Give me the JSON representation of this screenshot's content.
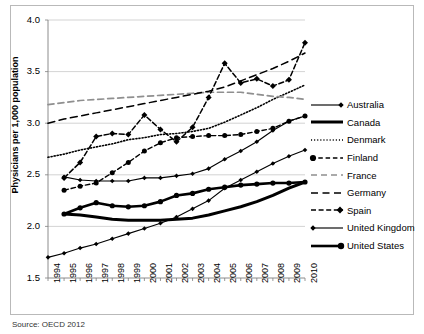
{
  "axes": {
    "ylabel": "Physicians per 1,000 population",
    "yticks": [
      "4.0",
      "3.5",
      "3.0",
      "2.5",
      "2.0",
      "1.5"
    ],
    "xticks": [
      "1994",
      "1995",
      "1996",
      "1997",
      "1998",
      "1999",
      "2000",
      "2001",
      "2002",
      "2003",
      "2004",
      "2005",
      "2006",
      "2007",
      "2008",
      "2009",
      "2010"
    ]
  },
  "legend": {
    "items": [
      {
        "label": "Australia",
        "key": "solid-diamond-marker"
      },
      {
        "label": "Canada",
        "key": "thick-solid-line"
      },
      {
        "label": "Denmark",
        "key": "dotted-line"
      },
      {
        "label": "Finland",
        "key": "dashed-circle-marker"
      },
      {
        "label": "France",
        "key": "light-dashed-line"
      },
      {
        "label": "Germany",
        "key": "dashed-line"
      },
      {
        "label": "Spain",
        "key": "dashed-diamond-marker"
      },
      {
        "label": "United Kingdom",
        "key": "solid-diamond-marker"
      },
      {
        "label": "United States",
        "key": "solid-circle-marker"
      }
    ]
  },
  "caption": "Source: OECD 2012",
  "colors": {
    "line": "#000000",
    "grid": "#c8c8c8",
    "axis": "#808080",
    "frame": "#b9b9b9",
    "background": "#ffffff"
  },
  "chart_data": {
    "type": "line",
    "title": "",
    "xlabel": "",
    "ylabel": "Physicians per 1,000 population",
    "ylim": [
      1.5,
      4.0
    ],
    "grid": true,
    "legend_position": "right",
    "x": [
      1994,
      1995,
      1996,
      1997,
      1998,
      1999,
      2000,
      2001,
      2002,
      2003,
      2004,
      2005,
      2006,
      2007,
      2008,
      2009,
      2010
    ],
    "series": [
      {
        "name": "Australia",
        "style": "solid-diamond",
        "values": [
          null,
          2.48,
          2.45,
          2.44,
          2.44,
          2.44,
          2.47,
          2.47,
          2.49,
          2.51,
          2.56,
          2.65,
          2.73,
          2.82,
          2.93,
          3.02,
          3.07
        ]
      },
      {
        "name": "Canada",
        "style": "thick-solid",
        "values": [
          null,
          2.12,
          2.11,
          2.09,
          2.07,
          2.06,
          2.06,
          2.06,
          2.07,
          2.08,
          2.11,
          2.15,
          2.19,
          2.24,
          2.3,
          2.37,
          2.43
        ]
      },
      {
        "name": "Denmark",
        "style": "dotted",
        "values": [
          2.67,
          2.7,
          2.74,
          2.77,
          2.8,
          2.84,
          2.86,
          2.89,
          2.9,
          2.92,
          2.95,
          3.01,
          3.08,
          3.15,
          3.23,
          3.3,
          3.37
        ]
      },
      {
        "name": "Finland",
        "style": "dashed-circle",
        "values": [
          null,
          2.35,
          2.39,
          2.42,
          2.52,
          2.62,
          2.73,
          2.81,
          2.86,
          2.87,
          2.88,
          2.88,
          2.89,
          2.92,
          2.95,
          3.02,
          3.07
        ]
      },
      {
        "name": "France",
        "style": "light-dashed",
        "values": [
          3.18,
          3.2,
          3.22,
          3.23,
          3.24,
          3.25,
          3.26,
          3.27,
          3.28,
          3.29,
          3.3,
          3.3,
          3.3,
          3.28,
          3.26,
          3.25,
          3.23
        ]
      },
      {
        "name": "Germany",
        "style": "dashed",
        "values": [
          3.0,
          3.04,
          3.07,
          3.1,
          3.13,
          3.16,
          3.19,
          3.22,
          3.25,
          3.28,
          3.31,
          3.35,
          3.41,
          3.47,
          3.53,
          3.6,
          3.68
        ]
      },
      {
        "name": "Spain",
        "style": "dashed-diamond",
        "values": [
          null,
          2.47,
          2.62,
          2.87,
          2.9,
          2.89,
          3.08,
          2.94,
          2.82,
          2.96,
          3.25,
          3.58,
          3.39,
          3.43,
          3.36,
          3.42,
          3.78
        ]
      },
      {
        "name": "United Kingdom",
        "style": "solid-diamond",
        "values": [
          1.7,
          1.74,
          1.79,
          1.83,
          1.88,
          1.93,
          1.98,
          2.03,
          2.09,
          2.17,
          2.25,
          2.37,
          2.45,
          2.53,
          2.61,
          2.68,
          2.74
        ]
      },
      {
        "name": "United States",
        "style": "solid-circle",
        "values": [
          null,
          2.12,
          2.18,
          2.23,
          2.2,
          2.19,
          2.2,
          2.24,
          2.3,
          2.32,
          2.36,
          2.38,
          2.4,
          2.41,
          2.42,
          2.42,
          2.43
        ]
      }
    ]
  }
}
